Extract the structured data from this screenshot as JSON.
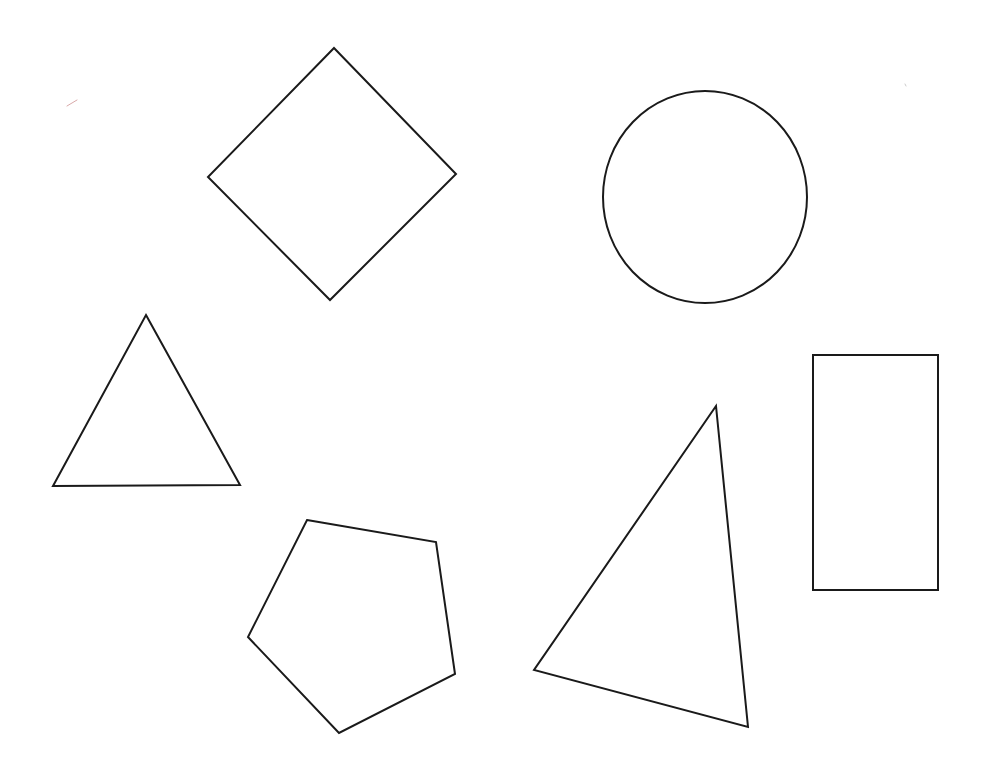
{
  "canvas": {
    "width": 984,
    "height": 770,
    "background": "#ffffff",
    "stroke_color": "#1a1a1a",
    "stroke_width": 2
  },
  "shapes": [
    {
      "id": "diamond",
      "type": "polygon",
      "label": "diamond",
      "points": "334,48 456,174 330,300 208,177"
    },
    {
      "id": "circle",
      "type": "ellipse",
      "label": "circle",
      "cx": 705,
      "cy": 197,
      "rx": 102,
      "ry": 106
    },
    {
      "id": "equilateral-triangle",
      "type": "polygon",
      "label": "equilateral triangle",
      "points": "146,315 240,485 53,486"
    },
    {
      "id": "rectangle",
      "type": "polygon",
      "label": "rectangle",
      "points": "813,355 938,355 938,590 813,590"
    },
    {
      "id": "pentagon",
      "type": "polygon",
      "label": "pentagon",
      "points": "307,520 436,542 455,674 339,733 248,637"
    },
    {
      "id": "scalene-triangle",
      "type": "polygon",
      "label": "scalene triangle",
      "points": "716,406 748,727 534,670"
    }
  ],
  "specks": [
    {
      "id": "speck-top-left",
      "x1": 67,
      "y1": 106,
      "x2": 77,
      "y2": 100,
      "color": "#d9a9a9"
    },
    {
      "id": "speck-top-right",
      "x1": 905,
      "y1": 84,
      "x2": 906,
      "y2": 86,
      "color": "#cccccc"
    }
  ]
}
